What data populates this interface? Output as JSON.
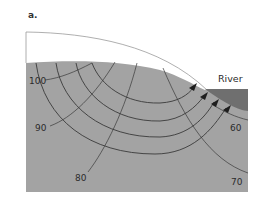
{
  "figure": {
    "panel_label": "a.",
    "river_label": "River",
    "equipotential_labels": [
      {
        "value": "100",
        "x": 30,
        "y": 84
      },
      {
        "value": "90",
        "x": 35,
        "y": 131
      },
      {
        "value": "80",
        "x": 75,
        "y": 181
      },
      {
        "value": "70",
        "x": 232,
        "y": 185
      },
      {
        "value": "60",
        "x": 231,
        "y": 131
      }
    ],
    "flow_line_count": 4,
    "colors": {
      "background": "#ffffff",
      "unsaturated_zone": "#ffffff",
      "aquifer": "#a3a3a3",
      "river": "#6f6f6f",
      "lines": "#3a3a3a"
    }
  }
}
